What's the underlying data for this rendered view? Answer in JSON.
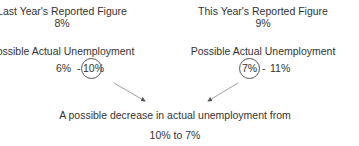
{
  "left": {
    "title": "Last Year's Reported Figure",
    "reported": "8%",
    "range_label": "Possible Actual Unemployment",
    "range_low": "6%",
    "range_sep": "-",
    "range_high": "10%",
    "circled": "10%"
  },
  "right": {
    "title": "This Year's Reported Figure",
    "reported": "9%",
    "range_label": "Possible Actual Unemployment",
    "range_low": "7%",
    "range_sep": "-",
    "range_high": "11%",
    "circled": "7%"
  },
  "conclusion": {
    "line1": "A possible decrease in actual unemployment from",
    "line2": "10% to 7%"
  },
  "colors": {
    "text": "#333333",
    "circle": "#555555",
    "arrow": "#777777",
    "background": "#ffffff"
  }
}
